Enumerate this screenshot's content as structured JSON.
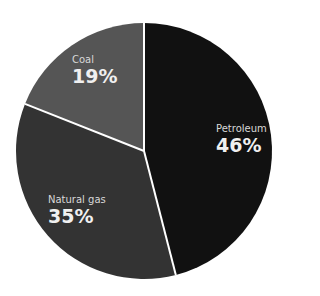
{
  "chart_data": {
    "type": "pie",
    "title": "",
    "categories": [
      "Petroleum",
      "Natural gas",
      "Coal"
    ],
    "values": [
      46,
      35,
      19
    ],
    "unit": "%",
    "colors": [
      "#111111",
      "#333333",
      "#555555"
    ],
    "labels": [
      {
        "name": "Petroleum",
        "pct": "46%"
      },
      {
        "name": "Natural gas",
        "pct": "35%"
      },
      {
        "name": "Coal",
        "pct": "19%"
      }
    ],
    "start_angle_deg": 0,
    "direction": "clockwise",
    "slice_separator_color": "#ffffff"
  }
}
